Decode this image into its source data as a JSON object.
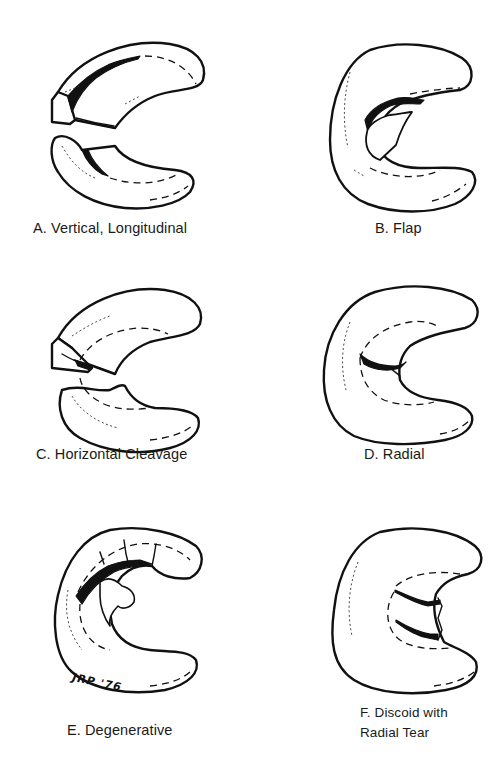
{
  "figure": {
    "signature": "JRP '76",
    "panels": [
      {
        "id": "A",
        "label": "A.  Vertical, Longitudinal",
        "tear_type": "vertical-longitudinal"
      },
      {
        "id": "B",
        "label": "B.  Flap",
        "tear_type": "flap"
      },
      {
        "id": "C",
        "label": "C.  Horizontal Cleavage",
        "tear_type": "horizontal-cleavage"
      },
      {
        "id": "D",
        "label": "D.  Radial",
        "tear_type": "radial"
      },
      {
        "id": "E",
        "label": "E.  Degenerative",
        "tear_type": "degenerative"
      },
      {
        "id": "F",
        "label_line1": "F.  Discoid with",
        "label_line2": "Radial Tear",
        "tear_type": "discoid-radial"
      }
    ]
  },
  "colors": {
    "background": "#ffffff",
    "ink": "#111111"
  }
}
